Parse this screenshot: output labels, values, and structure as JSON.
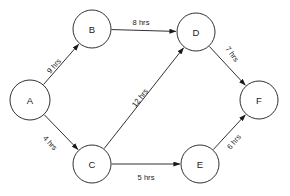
{
  "diagram": {
    "type": "directed-network-graph",
    "background_color": "#ffffff",
    "stroke_color": "#1a1a1a",
    "nodes": [
      {
        "id": "A",
        "label": "A",
        "cx": 30,
        "cy": 100,
        "r": 20
      },
      {
        "id": "B",
        "label": "B",
        "cx": 92,
        "cy": 29,
        "r": 19
      },
      {
        "id": "C",
        "label": "C",
        "cx": 92,
        "cy": 164,
        "r": 19
      },
      {
        "id": "D",
        "label": "D",
        "cx": 196,
        "cy": 32,
        "r": 19
      },
      {
        "id": "E",
        "label": "E",
        "cx": 200,
        "cy": 164,
        "r": 19
      },
      {
        "id": "F",
        "label": "F",
        "cx": 259,
        "cy": 100,
        "r": 19
      }
    ],
    "edges": [
      {
        "from": "A",
        "to": "B",
        "label": "9 hrs",
        "weight": 9,
        "unit": "hrs",
        "label_x": 54,
        "label_y": 66,
        "label_rotation": -49
      },
      {
        "from": "A",
        "to": "C",
        "label": "4 hrs",
        "weight": 4,
        "unit": "hrs",
        "label_x": 50,
        "label_y": 143,
        "label_rotation": 47
      },
      {
        "from": "B",
        "to": "D",
        "label": "8 hrs",
        "weight": 8,
        "unit": "hrs",
        "label_x": 141,
        "label_y": 22,
        "label_rotation": 0
      },
      {
        "from": "C",
        "to": "D",
        "label": "12 hrs",
        "weight": 12,
        "unit": "hrs",
        "label_x": 140,
        "label_y": 98,
        "label_rotation": -52
      },
      {
        "from": "C",
        "to": "E",
        "label": "5 hrs",
        "weight": 5,
        "unit": "hrs",
        "label_x": 146,
        "label_y": 177,
        "label_rotation": 0
      },
      {
        "from": "D",
        "to": "F",
        "label": "7 hrs",
        "weight": 7,
        "unit": "hrs",
        "label_x": 232,
        "label_y": 54,
        "label_rotation": 54
      },
      {
        "from": "E",
        "to": "F",
        "label": "6 hrs",
        "weight": 6,
        "unit": "hrs",
        "label_x": 234,
        "label_y": 142,
        "label_rotation": -50
      }
    ]
  }
}
